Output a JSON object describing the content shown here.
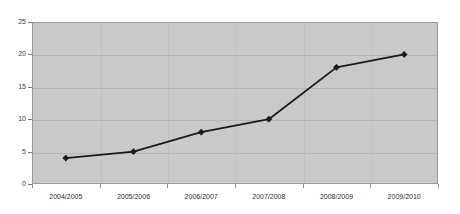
{
  "chart_data": {
    "type": "line",
    "title": "",
    "subtitle": "",
    "xlabel": "",
    "ylabel": "",
    "categories": [
      "2004/2005",
      "2005/2006",
      "2006/2007",
      "2007/2008",
      "2008/2009",
      "2009/2010"
    ],
    "series": [
      {
        "name": "",
        "values": [
          4,
          5,
          8,
          10,
          18,
          20
        ],
        "marker": "diamond",
        "line_color": "#1a1a1a",
        "marker_color": "#1a1a1a"
      }
    ],
    "ylim": [
      0,
      25
    ],
    "y_ticks": [
      0,
      5,
      10,
      15,
      20,
      25
    ],
    "y_tick_labels": [
      "0",
      "5",
      "10",
      "15",
      "20",
      "25"
    ],
    "grid": true,
    "grid_axis": "y",
    "legend": false,
    "legend_position": "none",
    "plot_background": "#c9c9c9",
    "figure_background": "#ffffff",
    "plot_border_color": "#9a9a9a",
    "gridline_color": "#b4b4b4"
  },
  "axes": {
    "y_axis_name": "value-axis",
    "x_axis_name": "category-axis"
  }
}
